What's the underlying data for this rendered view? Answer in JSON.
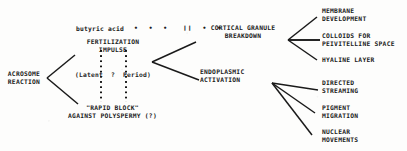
{
  "diagram": {
    "ink_color": "#1a1a1a",
    "background_color": "#fdfdfc",
    "stimulus": {
      "label": "butyric acid",
      "connector_style": "dotted-with-double-bar",
      "connector_marks": "•  •  •   ❙❙  •  •"
    },
    "nodes": [
      {
        "id": "acrosome-reaction",
        "label": "ACROSOME\nREACTION"
      },
      {
        "id": "fertilization-impulse",
        "label": "FERTILIZATION\nIMPULSE"
      },
      {
        "id": "latent-period",
        "label": "(Latent  ?  Period)"
      },
      {
        "id": "rapid-block",
        "label": "\"RAPID BLOCK\"\nAGAINST POLYSPERMY (?)"
      },
      {
        "id": "cortical-granule-breakdown",
        "label": "CORTICAL GRANULE\nBREAKDOWN"
      },
      {
        "id": "endoplasmic-activation",
        "label": "ENDOPLASMIC\nACTIVATION"
      }
    ],
    "outcomes_cortical": [
      {
        "id": "membrane-development",
        "label": "MEMBRANE\nDEVELOPMENT"
      },
      {
        "id": "colloids-perivitelline",
        "label": "COLLOIDS FOR\nPEIVITELLINE SPACE"
      },
      {
        "id": "hyaline-layer",
        "label": "HYALINE LAYER"
      }
    ],
    "outcomes_endoplasmic": [
      {
        "id": "directed-streaming",
        "label": "DIRECTED\nSTREAMING"
      },
      {
        "id": "pigment-migration",
        "label": "PIGMENT\nMIGRATION"
      },
      {
        "id": "nuclear-movements",
        "label": "NUCLEAR\nMOVEMENTS"
      }
    ]
  }
}
